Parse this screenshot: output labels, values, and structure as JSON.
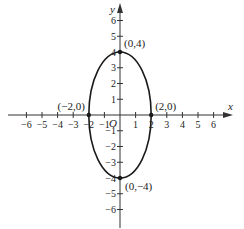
{
  "chart_data": {
    "type": "line",
    "title": "",
    "xlabel": "x",
    "ylabel": "y",
    "origin_label": "O",
    "xlim": [
      -6,
      6
    ],
    "ylim": [
      -6,
      6
    ],
    "grid": false,
    "x_ticks": [
      -6,
      -5,
      -4,
      -3,
      -2,
      -1,
      1,
      2,
      3,
      4,
      5,
      6
    ],
    "y_ticks": [
      -6,
      -5,
      -4,
      -3,
      -2,
      -1,
      1,
      2,
      3,
      4,
      5,
      6
    ],
    "tick_labels": {
      "x": [
        "−6",
        "−5",
        "−4",
        "−3",
        "−2",
        "−1",
        "1",
        "2",
        "3",
        "4",
        "5",
        "6"
      ],
      "y": [
        "−6",
        "−5",
        "−4",
        "−3",
        "−2",
        "−1",
        "1",
        "2",
        "3",
        "4",
        "5",
        "6"
      ]
    },
    "series": [
      {
        "name": "ellipse",
        "shape": "ellipse",
        "center": [
          0,
          0
        ],
        "semi_axis_x": 2,
        "semi_axis_y": 4,
        "equation": "x^2/4 + y^2/16 = 1"
      }
    ],
    "points": [
      {
        "x": 0,
        "y": 4,
        "label": "(0,4)",
        "label_pos": "upper-right"
      },
      {
        "x": 0,
        "y": -4,
        "label": "(0,−4)",
        "label_pos": "lower-right"
      },
      {
        "x": -2,
        "y": 0,
        "label": "(−2,0)",
        "label_pos": "upper-left"
      },
      {
        "x": 2,
        "y": 0,
        "label": "(2,0)",
        "label_pos": "upper-right"
      }
    ]
  },
  "colors": {
    "axis": "#333333",
    "curve": "#1a1a1a",
    "text": "#222222"
  }
}
